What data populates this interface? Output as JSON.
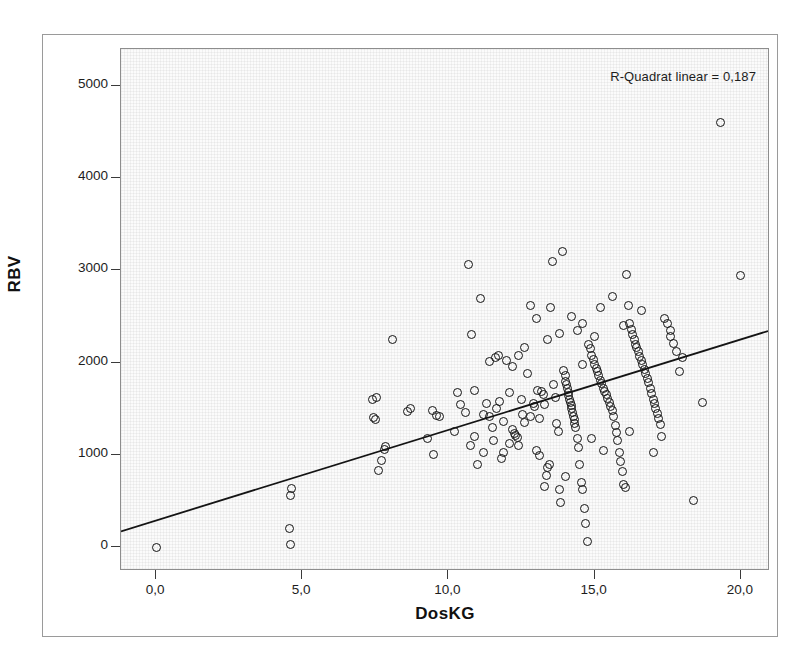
{
  "chart_data": {
    "type": "scatter",
    "title": "",
    "xlabel": "DosKG",
    "ylabel": "RBV",
    "xlim": [
      -1.2,
      21.0
    ],
    "ylim": [
      -260,
      5400
    ],
    "xticks": [
      "0,0",
      "5,0",
      "10,0",
      "15,0",
      "20,0"
    ],
    "xtick_values": [
      0,
      5,
      10,
      15,
      20
    ],
    "yticks": [
      "0",
      "1000",
      "2000",
      "3000",
      "4000",
      "5000"
    ],
    "ytick_values": [
      0,
      1000,
      2000,
      3000,
      4000,
      5000
    ],
    "grid": false,
    "legend": "none",
    "annotation": "R-Quadrat linear = 0,187",
    "r_squared": 0.187,
    "marker": "open-circle",
    "marker_color": "#141414",
    "fit_line": {
      "type": "linear",
      "x_start": -1.2,
      "y_start": 150,
      "x_end": 21.0,
      "y_end": 2330,
      "slope": 98.2,
      "intercept": 268,
      "color": "#141414"
    },
    "points": [
      [
        0.0,
        0
      ],
      [
        4.55,
        200
      ],
      [
        4.6,
        30
      ],
      [
        4.6,
        560
      ],
      [
        4.62,
        640
      ],
      [
        7.4,
        1600
      ],
      [
        7.45,
        1400
      ],
      [
        7.5,
        1380
      ],
      [
        7.55,
        1620
      ],
      [
        7.6,
        830
      ],
      [
        7.7,
        940
      ],
      [
        7.8,
        1060
      ],
      [
        7.85,
        1090
      ],
      [
        8.1,
        2250
      ],
      [
        8.6,
        1470
      ],
      [
        8.7,
        1500
      ],
      [
        9.3,
        1180
      ],
      [
        9.45,
        1480
      ],
      [
        9.5,
        1000
      ],
      [
        9.6,
        1430
      ],
      [
        9.7,
        1410
      ],
      [
        10.2,
        1250
      ],
      [
        10.4,
        1540
      ],
      [
        10.6,
        1460
      ],
      [
        10.7,
        3060
      ],
      [
        10.75,
        1100
      ],
      [
        10.8,
        2300
      ],
      [
        10.9,
        1200
      ],
      [
        11.0,
        900
      ],
      [
        11.1,
        2700
      ],
      [
        11.2,
        1030
      ],
      [
        11.3,
        1560
      ],
      [
        11.4,
        1410
      ],
      [
        11.5,
        1300
      ],
      [
        11.55,
        1160
      ],
      [
        11.6,
        2050
      ],
      [
        11.65,
        1500
      ],
      [
        11.7,
        2080
      ],
      [
        11.75,
        1580
      ],
      [
        11.8,
        960
      ],
      [
        11.9,
        1020
      ],
      [
        12.0,
        2020
      ],
      [
        12.1,
        1680
      ],
      [
        12.2,
        1270
      ],
      [
        12.25,
        1230
      ],
      [
        12.3,
        1210
      ],
      [
        12.35,
        1190
      ],
      [
        12.4,
        1100
      ],
      [
        12.5,
        1600
      ],
      [
        12.55,
        1440
      ],
      [
        12.6,
        1350
      ],
      [
        12.7,
        1880
      ],
      [
        12.8,
        2620
      ],
      [
        12.9,
        1560
      ],
      [
        12.95,
        1520
      ],
      [
        13.0,
        2480
      ],
      [
        13.05,
        1700
      ],
      [
        13.1,
        1390
      ],
      [
        13.2,
        1690
      ],
      [
        13.25,
        1650
      ],
      [
        13.3,
        1540
      ],
      [
        13.35,
        780
      ],
      [
        13.4,
        860
      ],
      [
        13.45,
        900
      ],
      [
        13.5,
        2600
      ],
      [
        13.55,
        3100
      ],
      [
        13.6,
        1760
      ],
      [
        13.65,
        1620
      ],
      [
        13.7,
        1340
      ],
      [
        13.75,
        1250
      ],
      [
        13.8,
        620
      ],
      [
        13.85,
        480
      ],
      [
        13.9,
        3200
      ],
      [
        13.95,
        1910
      ],
      [
        14.0,
        1860
      ],
      [
        14.02,
        1800
      ],
      [
        14.05,
        1760
      ],
      [
        14.08,
        1720
      ],
      [
        14.1,
        1680
      ],
      [
        14.12,
        1640
      ],
      [
        14.15,
        1600
      ],
      [
        14.18,
        1570
      ],
      [
        14.2,
        1530
      ],
      [
        14.22,
        1500
      ],
      [
        14.25,
        1460
      ],
      [
        14.28,
        1420
      ],
      [
        14.3,
        1380
      ],
      [
        14.32,
        1340
      ],
      [
        14.35,
        1300
      ],
      [
        14.4,
        1180
      ],
      [
        14.45,
        1080
      ],
      [
        14.5,
        900
      ],
      [
        14.55,
        700
      ],
      [
        14.6,
        620
      ],
      [
        14.65,
        420
      ],
      [
        14.7,
        260
      ],
      [
        14.75,
        60
      ],
      [
        14.8,
        2200
      ],
      [
        14.85,
        2150
      ],
      [
        14.9,
        2080
      ],
      [
        14.95,
        2030
      ],
      [
        15.0,
        1980
      ],
      [
        15.05,
        1940
      ],
      [
        15.1,
        1900
      ],
      [
        15.15,
        1860
      ],
      [
        15.2,
        1810
      ],
      [
        15.25,
        1770
      ],
      [
        15.3,
        1720
      ],
      [
        15.35,
        1690
      ],
      [
        15.4,
        1650
      ],
      [
        15.45,
        1610
      ],
      [
        15.5,
        1570
      ],
      [
        15.55,
        1520
      ],
      [
        15.6,
        1480
      ],
      [
        15.65,
        1420
      ],
      [
        15.7,
        1320
      ],
      [
        15.75,
        1240
      ],
      [
        15.8,
        1160
      ],
      [
        15.85,
        1020
      ],
      [
        15.9,
        930
      ],
      [
        15.95,
        820
      ],
      [
        16.0,
        680
      ],
      [
        16.05,
        650
      ],
      [
        16.1,
        2950
      ],
      [
        16.15,
        2620
      ],
      [
        16.2,
        2420
      ],
      [
        16.25,
        2360
      ],
      [
        16.3,
        2300
      ],
      [
        16.35,
        2250
      ],
      [
        16.4,
        2200
      ],
      [
        16.45,
        2160
      ],
      [
        16.5,
        2120
      ],
      [
        16.55,
        2070
      ],
      [
        16.6,
        2020
      ],
      [
        16.65,
        1980
      ],
      [
        16.7,
        1930
      ],
      [
        16.75,
        1880
      ],
      [
        16.8,
        1830
      ],
      [
        16.85,
        1780
      ],
      [
        16.9,
        1720
      ],
      [
        16.95,
        1670
      ],
      [
        17.0,
        1600
      ],
      [
        17.05,
        1560
      ],
      [
        17.1,
        1500
      ],
      [
        17.15,
        1450
      ],
      [
        17.2,
        1390
      ],
      [
        17.25,
        1330
      ],
      [
        17.3,
        1200
      ],
      [
        17.4,
        2480
      ],
      [
        17.5,
        2420
      ],
      [
        17.6,
        2280
      ],
      [
        17.7,
        2210
      ],
      [
        17.8,
        2120
      ],
      [
        17.9,
        1900
      ],
      [
        18.0,
        2050
      ],
      [
        18.4,
        500
      ],
      [
        18.7,
        1570
      ],
      [
        19.3,
        4600
      ],
      [
        20.0,
        2940
      ],
      [
        13.0,
        1050
      ],
      [
        13.1,
        990
      ],
      [
        12.2,
        1960
      ],
      [
        12.4,
        2080
      ],
      [
        12.6,
        2160
      ],
      [
        12.8,
        1420
      ],
      [
        11.9,
        1360
      ],
      [
        11.4,
        2010
      ],
      [
        10.9,
        1700
      ],
      [
        10.3,
        1680
      ],
      [
        14.4,
        2350
      ],
      [
        14.6,
        2420
      ],
      [
        14.2,
        2500
      ],
      [
        15.2,
        2600
      ],
      [
        15.6,
        2720
      ],
      [
        16.0,
        2400
      ],
      [
        13.4,
        2250
      ],
      [
        13.8,
        2320
      ],
      [
        12.1,
        1120
      ],
      [
        11.2,
        1440
      ],
      [
        14.9,
        1180
      ],
      [
        15.3,
        1050
      ],
      [
        16.2,
        1250
      ],
      [
        17.0,
        1020
      ],
      [
        13.3,
        660
      ],
      [
        14.0,
        760
      ],
      [
        14.6,
        1980
      ],
      [
        15.0,
        2280
      ],
      [
        16.6,
        2560
      ],
      [
        17.6,
        2350
      ]
    ]
  },
  "axes": {
    "y_title": "RBV",
    "x_title": "DosKG"
  }
}
